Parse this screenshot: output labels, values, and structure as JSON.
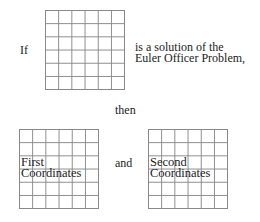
{
  "diagram": {
    "premise_prefix": "If",
    "premise_suffix_line1": "is a solution of the",
    "premise_suffix_line2": "Euler Officer Problem,",
    "connector": "then",
    "and": "and",
    "grids": {
      "top": {
        "rows": 6,
        "cols": 6,
        "label": ""
      },
      "left": {
        "rows": 6,
        "cols": 6,
        "label_line1": "First",
        "label_line2": "Coordinates"
      },
      "right": {
        "rows": 6,
        "cols": 6,
        "label_line1": "Second",
        "label_line2": "Coordinates"
      }
    }
  }
}
